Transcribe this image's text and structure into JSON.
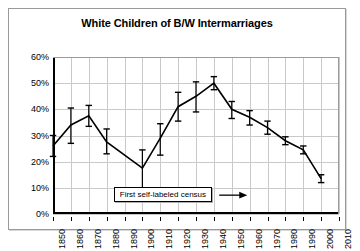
{
  "chart_data": {
    "type": "line",
    "title": "White Children of B/W Intermarriages",
    "xlabel": "",
    "ylabel": "",
    "xlim": [
      1850,
      2010
    ],
    "ylim": [
      0,
      0.6
    ],
    "ytick_labels": [
      "0%",
      "10%",
      "20%",
      "30%",
      "40%",
      "50%",
      "60%"
    ],
    "ytick_values": [
      0,
      10,
      20,
      30,
      40,
      50,
      60
    ],
    "xtick_labels": [
      "1850",
      "1860",
      "1870",
      "1880",
      "1890",
      "1900",
      "1910",
      "1920",
      "1930",
      "1940",
      "1950",
      "1960",
      "1970",
      "1980",
      "1990",
      "2000",
      "2010"
    ],
    "grid": true,
    "legend": "none",
    "series": [
      {
        "name": "White children of B/W intermarriages",
        "x": [
          1850,
          1860,
          1870,
          1880,
          1900,
          1910,
          1920,
          1930,
          1940,
          1950,
          1960,
          1970,
          1980,
          1990,
          2000
        ],
        "values": [
          26.0,
          34.0,
          37.5,
          27.5,
          17.5,
          29.0,
          41.0,
          45.0,
          50.0,
          40.0,
          37.0,
          33.0,
          28.0,
          24.5,
          13.5
        ],
        "err_low": [
          22.0,
          27.0,
          33.5,
          23.0,
          10.0,
          22.5,
          35.5,
          39.0,
          47.5,
          36.5,
          34.0,
          30.5,
          26.5,
          23.0,
          12.0
        ],
        "err_high": [
          30.0,
          40.5,
          41.5,
          32.5,
          24.5,
          34.5,
          46.5,
          50.5,
          52.5,
          43.0,
          39.5,
          35.5,
          29.5,
          26.0,
          15.0
        ]
      }
    ],
    "annotations": [
      {
        "text": "First self-labeled census",
        "arrow": "→",
        "points_to_year": 1900
      }
    ],
    "colors": {
      "line": "#000000",
      "grid": "#c9c9c9",
      "axis": "#000000",
      "background": "#ffffff"
    }
  }
}
